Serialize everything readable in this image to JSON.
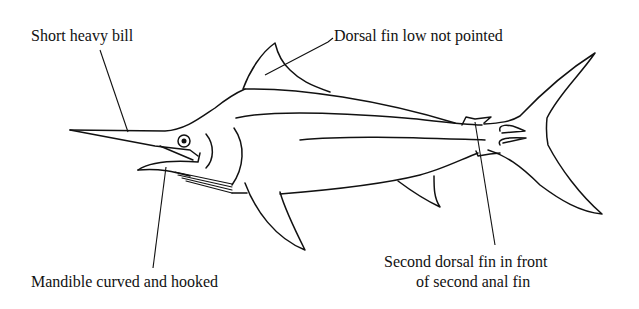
{
  "diagram": {
    "labels": {
      "bill": "Short heavy bill",
      "dorsal": "Dorsal fin low not pointed",
      "mandible": "Mandible curved and hooked",
      "second_dorsal_line1": "Second dorsal fin in front",
      "second_dorsal_line2": "of second anal fin"
    }
  }
}
